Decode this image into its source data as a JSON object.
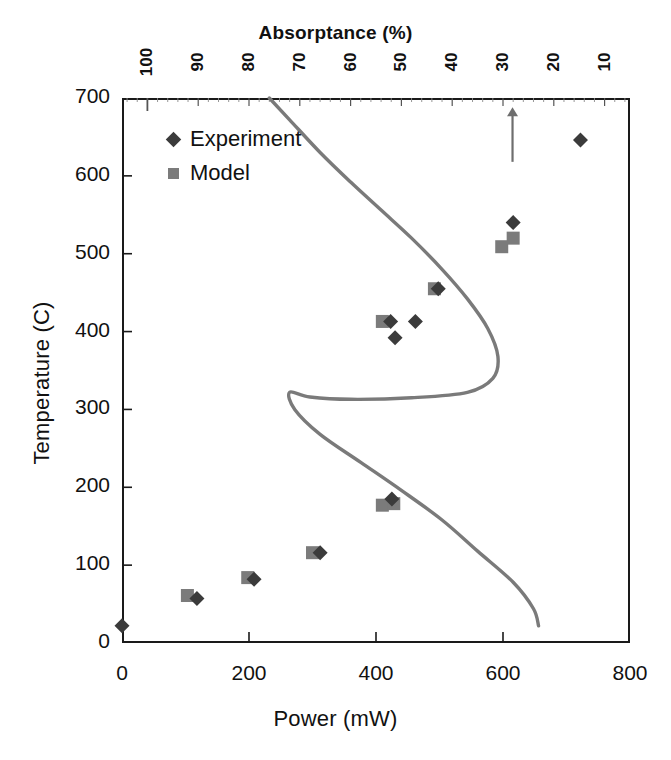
{
  "chart_data": {
    "type": "scatter",
    "title": "",
    "xlabel": "Power (mW)",
    "ylabel": "Temperature (C)",
    "top_axis_label": "Absorptance (%)",
    "xlim": [
      0,
      800
    ],
    "ylim": [
      0,
      700
    ],
    "top_xlim": [
      105,
      5
    ],
    "grid": false,
    "legend_position": "top-left",
    "x_ticks": [
      "0",
      "200",
      "400",
      "600",
      "800"
    ],
    "x_tick_values": [
      0,
      200,
      400,
      600,
      800
    ],
    "y_ticks": [
      "0",
      "100",
      "200",
      "300",
      "400",
      "500",
      "600",
      "700"
    ],
    "y_tick_values": [
      0,
      100,
      200,
      300,
      400,
      500,
      600,
      700
    ],
    "top_ticks": [
      "100",
      "90",
      "80",
      "70",
      "60",
      "50",
      "40",
      "30",
      "20",
      "10"
    ],
    "top_tick_values": [
      100,
      90,
      80,
      70,
      60,
      50,
      40,
      30,
      20,
      10
    ],
    "series": [
      {
        "name": "Experiment",
        "marker": "diamond",
        "color": "#3b3b3b",
        "points": [
          {
            "x": 0,
            "y": 22
          },
          {
            "x": 118,
            "y": 57
          },
          {
            "x": 208,
            "y": 82
          },
          {
            "x": 312,
            "y": 116
          },
          {
            "x": 425,
            "y": 185
          },
          {
            "x": 430,
            "y": 392
          },
          {
            "x": 423,
            "y": 413
          },
          {
            "x": 462,
            "y": 413
          },
          {
            "x": 498,
            "y": 455
          },
          {
            "x": 616,
            "y": 540
          },
          {
            "x": 722,
            "y": 646
          }
        ]
      },
      {
        "name": "Model",
        "marker": "square",
        "color": "#7b7b7b",
        "points": [
          {
            "x": 103,
            "y": 61
          },
          {
            "x": 198,
            "y": 84
          },
          {
            "x": 300,
            "y": 116
          },
          {
            "x": 410,
            "y": 177
          },
          {
            "x": 428,
            "y": 179
          },
          {
            "x": 410,
            "y": 413
          },
          {
            "x": 492,
            "y": 455
          },
          {
            "x": 598,
            "y": 509
          },
          {
            "x": 616,
            "y": 520
          }
        ]
      }
    ],
    "absorptance_curve": {
      "name": "Absorptance",
      "color": "#7a7a7a",
      "axis": "top",
      "points": [
        {
          "absorptance": 76,
          "y": 700
        },
        {
          "absorptance": 72,
          "y": 672
        },
        {
          "absorptance": 66,
          "y": 630
        },
        {
          "absorptance": 60,
          "y": 592
        },
        {
          "absorptance": 54,
          "y": 556
        },
        {
          "absorptance": 48,
          "y": 520
        },
        {
          "absorptance": 42,
          "y": 480
        },
        {
          "absorptance": 37,
          "y": 442
        },
        {
          "absorptance": 33,
          "y": 404
        },
        {
          "absorptance": 31,
          "y": 368
        },
        {
          "absorptance": 32,
          "y": 340
        },
        {
          "absorptance": 37,
          "y": 322
        },
        {
          "absorptance": 48,
          "y": 315
        },
        {
          "absorptance": 60,
          "y": 313
        },
        {
          "absorptance": 68,
          "y": 316
        },
        {
          "absorptance": 72,
          "y": 322
        },
        {
          "absorptance": 71,
          "y": 300
        },
        {
          "absorptance": 66,
          "y": 268
        },
        {
          "absorptance": 58,
          "y": 232
        },
        {
          "absorptance": 50,
          "y": 196
        },
        {
          "absorptance": 42,
          "y": 158
        },
        {
          "absorptance": 35,
          "y": 118
        },
        {
          "absorptance": 28,
          "y": 78
        },
        {
          "absorptance": 24,
          "y": 44
        },
        {
          "absorptance": 23,
          "y": 22
        }
      ]
    },
    "annotations": [
      {
        "type": "arrow",
        "direction": "up",
        "x": 615,
        "y_start": 618,
        "y_end": 688,
        "color": "#6e6e6e"
      }
    ]
  },
  "legend": {
    "items": [
      {
        "label": "Experiment",
        "marker": "diamond",
        "color": "#3b3b3b"
      },
      {
        "label": "Model",
        "marker": "square",
        "color": "#7b7b7b"
      }
    ]
  }
}
